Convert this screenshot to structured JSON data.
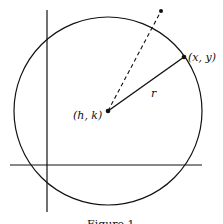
{
  "diagram": {
    "center_label": "(h, k)",
    "point_label": "(x, y)",
    "radius_label": "r",
    "caption": "Figure 1",
    "stroke_color": "#111111"
  }
}
